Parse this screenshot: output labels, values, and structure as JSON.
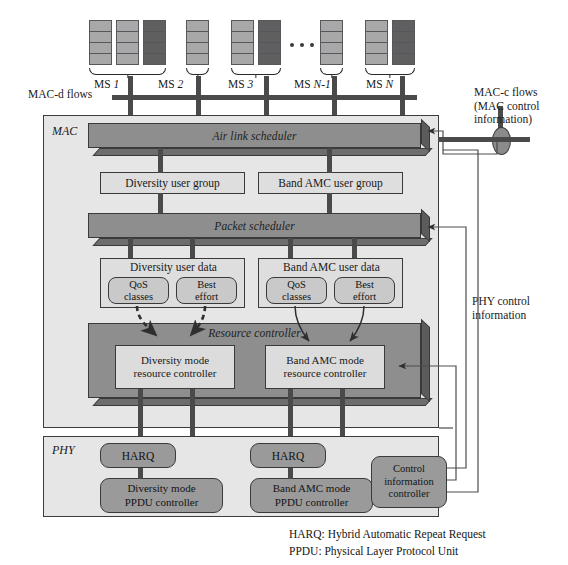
{
  "figure": {
    "colors": {
      "slab_face": "#8e8e8e",
      "slab_bevel_bottom": "#6d6d6d",
      "slab_bevel_right": "#5c5c5c",
      "layer_bg": "#e6e6e6",
      "node_bg": "#d4d4d4",
      "rounded_node_bg": "#9a9a9a",
      "ms_light": "#a8a8a8",
      "ms_dark": "#5f5f5f",
      "line": "#4a4a4a",
      "text": "#1a1a1a"
    }
  },
  "mobile_stations": {
    "groups": [
      {
        "label_prefix": "MS",
        "label_value": "1",
        "blocks": [
          "light",
          "light",
          "dark"
        ]
      },
      {
        "label_prefix": "MS",
        "label_value": "2",
        "blocks": [
          "light"
        ]
      },
      {
        "label_prefix": "MS",
        "label_value": "3",
        "blocks": [
          "light",
          "dark"
        ]
      },
      {
        "label_prefix": "MS",
        "label_value": "N-1",
        "blocks": [
          "light"
        ]
      },
      {
        "label_prefix": "MS",
        "label_value": "N",
        "blocks": [
          "light",
          "dark"
        ]
      }
    ],
    "ellipsis": "•••",
    "segments_per_block": 4
  },
  "flows": {
    "mac_d": "MAC-d flows",
    "mac_c_line1": "MAC-c flows",
    "mac_c_line2": "(MAC control",
    "mac_c_line3": "information)",
    "phy_control_line1": "PHY control",
    "phy_control_line2": "information"
  },
  "mac_layer": {
    "label": "MAC",
    "air_link_scheduler": "Air link scheduler",
    "packet_scheduler": "Packet scheduler",
    "resource_controller": "Resource controller",
    "user_groups": [
      {
        "label": "Diversity user group"
      },
      {
        "label": "Band AMC user group"
      }
    ],
    "user_data": [
      {
        "label": "Diversity user data",
        "children": [
          {
            "line1": "QoS",
            "line2": "classes"
          },
          {
            "line1": "Best",
            "line2": "effort"
          }
        ]
      },
      {
        "label": "Band AMC user data",
        "children": [
          {
            "line1": "QoS",
            "line2": "classes"
          },
          {
            "line1": "Best",
            "line2": "effort"
          }
        ]
      }
    ],
    "mode_controllers": [
      {
        "line1": "Diversity mode",
        "line2": "resource controller"
      },
      {
        "line1": "Band AMC mode",
        "line2": "resource controller"
      }
    ]
  },
  "phy_layer": {
    "label": "PHY",
    "harq": [
      {
        "label": "HARQ"
      },
      {
        "label": "HARQ"
      }
    ],
    "ppdu_controllers": [
      {
        "line1": "Diversity mode",
        "line2": "PPDU controller"
      },
      {
        "line1": "Band AMC mode",
        "line2": "PPDU controller"
      }
    ],
    "control_information_controller": {
      "line1": "Control",
      "line2": "information",
      "line3": "controller"
    }
  },
  "legend": {
    "harq": "HARQ: Hybrid Automatic Repeat Request",
    "ppdu": "PPDU: Physical Layer Protocol Unit"
  }
}
